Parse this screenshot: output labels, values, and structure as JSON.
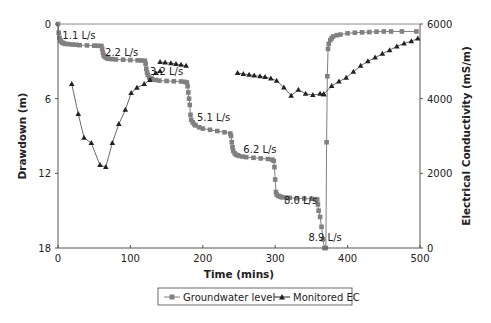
{
  "chart_data": {
    "type": "line",
    "title": "",
    "xlabel": "Time (mins)",
    "ylabel": "Drawdown (m)",
    "y2label": "Electrical Conductivity (mS/m)",
    "xlim": [
      0,
      500
    ],
    "ylim": [
      0,
      18
    ],
    "y_inverted": true,
    "y2lim": [
      0,
      6000
    ],
    "xticks": [
      "0",
      "100",
      "200",
      "300",
      "400",
      "500"
    ],
    "yticks": [
      "0",
      "6",
      "12",
      "18"
    ],
    "y2ticks": [
      "0",
      "2000",
      "4000",
      "6000"
    ],
    "grid": false,
    "legend_position": "bottom",
    "colors": {
      "groundwater": "#808080",
      "ec": "#222222",
      "axis": "#555555"
    },
    "annotations": [
      {
        "text": "1.1 L/s",
        "x": 6,
        "y": 1.2
      },
      {
        "text": "2.2 L/s",
        "x": 65,
        "y": 2.6
      },
      {
        "text": "3.2 L/s",
        "x": 127,
        "y": 4.1
      },
      {
        "text": "5.1 L/s",
        "x": 192,
        "y": 7.8
      },
      {
        "text": "6.2 L/s",
        "x": 256,
        "y": 10.4
      },
      {
        "text": "8.0 L/s",
        "x": 312,
        "y": 14.5
      },
      {
        "text": "8.9 L/s",
        "x": 346,
        "y": 17.4
      }
    ],
    "series": [
      {
        "name": "Groundwater level",
        "marker": "square",
        "axis": "left",
        "x": [
          0,
          1,
          2,
          3,
          4,
          6,
          8,
          10,
          15,
          20,
          25,
          30,
          40,
          50,
          55,
          60,
          61,
          62,
          63,
          64,
          66,
          68,
          70,
          75,
          80,
          90,
          100,
          110,
          115,
          120,
          121,
          122,
          123,
          124,
          126,
          128,
          130,
          135,
          140,
          150,
          160,
          170,
          175,
          178,
          179,
          180,
          181,
          182,
          183,
          184,
          186,
          188,
          190,
          195,
          200,
          210,
          220,
          230,
          238,
          239,
          240,
          241,
          242,
          244,
          246,
          248,
          250,
          255,
          260,
          270,
          280,
          290,
          296,
          298,
          299,
          300,
          301,
          302,
          304,
          306,
          308,
          310,
          315,
          320,
          330,
          340,
          350,
          355,
          358,
          359,
          360,
          362,
          364,
          366,
          368,
          370,
          371,
          372,
          373,
          374,
          376,
          378,
          380,
          385,
          390,
          400,
          410,
          420,
          430,
          440,
          450,
          460,
          475,
          495
        ],
        "values": [
          0,
          0.7,
          1.1,
          1.3,
          1.4,
          1.5,
          1.55,
          1.6,
          1.62,
          1.65,
          1.67,
          1.7,
          1.72,
          1.74,
          1.75,
          1.76,
          2.0,
          2.3,
          2.5,
          2.6,
          2.7,
          2.75,
          2.8,
          2.82,
          2.85,
          2.87,
          2.9,
          2.92,
          2.93,
          2.95,
          3.2,
          3.6,
          3.9,
          4.1,
          4.3,
          4.4,
          4.45,
          4.5,
          4.55,
          4.58,
          4.6,
          4.62,
          4.65,
          4.7,
          5.0,
          5.5,
          6.0,
          6.5,
          7.3,
          7.7,
          7.9,
          8.05,
          8.15,
          8.3,
          8.4,
          8.5,
          8.6,
          8.7,
          8.8,
          9.0,
          9.5,
          9.9,
          10.2,
          10.4,
          10.5,
          10.55,
          10.6,
          10.65,
          10.7,
          10.75,
          10.8,
          10.85,
          10.9,
          11.0,
          11.5,
          12.5,
          13.5,
          13.7,
          13.8,
          13.85,
          13.9,
          13.92,
          13.95,
          13.97,
          14.0,
          14.02,
          14.05,
          14.07,
          14.1,
          14.5,
          15.0,
          15.5,
          16.3,
          17.3,
          18.0,
          18.0,
          9.5,
          4.2,
          2.0,
          1.6,
          1.3,
          1.15,
          1.0,
          0.9,
          0.85,
          0.75,
          0.7,
          0.67,
          0.65,
          0.62,
          0.6,
          0.6,
          0.6,
          0.6
        ]
      },
      {
        "name": "Monitored EC",
        "marker": "triangle",
        "axis": "right",
        "segments": [
          {
            "x": [
              19,
              28,
              36,
              46,
              58,
              66,
              75,
              84,
              93,
              101,
              109,
              119,
              127,
              135,
              141
            ],
            "values": [
              4390,
              3590,
              2950,
              2810,
              2220,
              2170,
              2810,
              3320,
              3700,
              4150,
              4290,
              4390,
              4500,
              4690,
              4740
            ]
          },
          {
            "x": [
              141,
              148,
              156,
              163,
              170,
              177
            ],
            "values": [
              4980,
              4970,
              4950,
              4930,
              4910,
              4880
            ]
          },
          {
            "x": [
              248,
              256,
              264,
              271,
              279,
              286,
              294,
              302,
              312,
              322,
              332,
              342,
              352,
              362,
              367
            ],
            "values": [
              4690,
              4660,
              4640,
              4620,
              4600,
              4580,
              4540,
              4480,
              4300,
              4080,
              4240,
              4130,
              4100,
              4130,
              4120
            ]
          },
          {
            "x": [
              367,
              378,
              388,
              398,
              408,
              418,
              428,
              438,
              448,
              458,
              468,
              478,
              488,
              497
            ],
            "values": [
              4120,
              4340,
              4460,
              4560,
              4720,
              4880,
              5000,
              5100,
              5200,
              5300,
              5400,
              5480,
              5540,
              5610
            ]
          }
        ]
      }
    ]
  },
  "legend": {
    "items": [
      {
        "label": "Groundwater level"
      },
      {
        "label": "Monitored EC"
      }
    ]
  }
}
